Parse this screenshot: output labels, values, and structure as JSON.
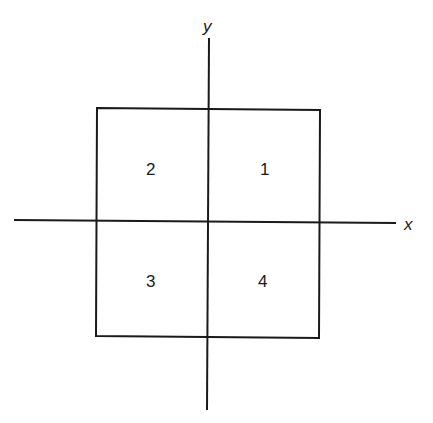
{
  "diagram": {
    "axes": {
      "x_label": "x",
      "y_label": "y"
    },
    "quadrants": [
      {
        "number": "1",
        "position": "upper-right"
      },
      {
        "number": "2",
        "position": "upper-left"
      },
      {
        "number": "3",
        "position": "lower-left"
      },
      {
        "number": "4",
        "position": "lower-right"
      }
    ],
    "colors": {
      "line": "#1a1a1a",
      "background": "#ffffff"
    }
  }
}
